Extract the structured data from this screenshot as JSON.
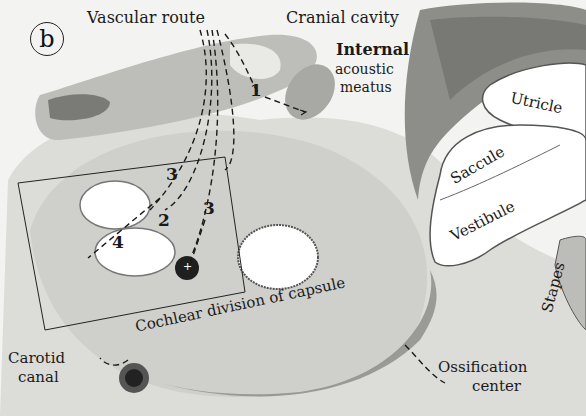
{
  "figure": {
    "panel_label": "b",
    "labels": {
      "vascular_route": "Vascular route",
      "cranial_cavity": "Cranial cavity",
      "internal_acoustic_meatus_1": "Internal",
      "internal_acoustic_meatus_2": "acoustic",
      "internal_acoustic_meatus_3": "meatus",
      "utricle": "Utricle",
      "saccule": "Saccule",
      "vestibule": "Vestibule",
      "stapes": "Stapes",
      "cochlear_division": "Cochlear division of capsule",
      "carotid_canal_1": "Carotid",
      "carotid_canal_2": "canal",
      "ossification_center_1": "Ossification",
      "ossification_center_2": "center"
    },
    "route_numbers": [
      "1",
      "2",
      "3",
      "3",
      "4"
    ],
    "marker_plus": "+",
    "colors": {
      "background": "#f4f4f2",
      "tissue_light": "#d9d9d6",
      "tissue_mid": "#b8b8b4",
      "tissue_dark": "#6e6e6a",
      "ink": "#1a1a1a",
      "cavity": "#ffffff"
    }
  }
}
